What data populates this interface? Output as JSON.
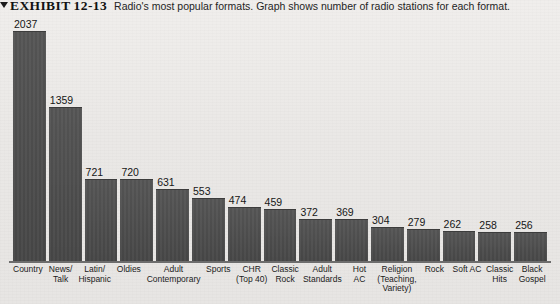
{
  "caption": {
    "marker": "triangle-marker",
    "exhibit_label": "EXHIBIT",
    "exhibit_number": "12-13",
    "text": "Radio's most popular formats. Graph shows number of radio stations for each format."
  },
  "colors": {
    "bar_fill": "#4c4c4c",
    "background": "#eceae8",
    "baseline": "#6d6d6d",
    "text": "#1b1b1b"
  },
  "chart_data": {
    "type": "bar",
    "title": "Radio's most popular formats. Graph shows number of radio stations for each format.",
    "xlabel": "",
    "ylabel": "",
    "ylim": [
      0,
      2037
    ],
    "grid": false,
    "legend": false,
    "categories": [
      [
        "Country"
      ],
      [
        "News/",
        "Talk"
      ],
      [
        "Latin/",
        "Hispanic"
      ],
      [
        "Oldies"
      ],
      [
        "Adult",
        "Contemporary"
      ],
      [
        "Sports"
      ],
      [
        "CHR",
        "(Top 40)"
      ],
      [
        "Classic",
        "Rock"
      ],
      [
        "Adult",
        "Standards"
      ],
      [
        "Hot",
        "AC"
      ],
      [
        "Religion",
        "(Teaching,",
        "Variety)"
      ],
      [
        "Rock"
      ],
      [
        "Soft AC"
      ],
      [
        "Classic",
        "Hits"
      ],
      [
        "Black",
        "Gospel"
      ]
    ],
    "values": [
      2037,
      1359,
      721,
      720,
      631,
      553,
      474,
      459,
      372,
      369,
      304,
      279,
      262,
      258,
      256
    ]
  }
}
